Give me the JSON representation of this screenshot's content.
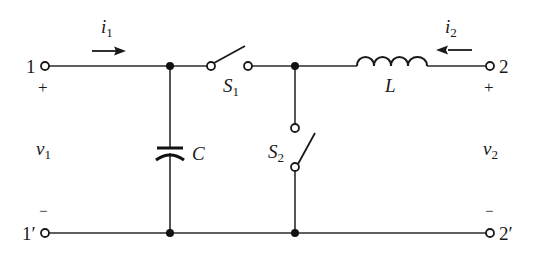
{
  "diagram": {
    "type": "two-port switched LC circuit",
    "colors": {
      "line": "#2a2a2a",
      "background": "#ffffff"
    },
    "ports": {
      "port1_top": "1",
      "port1_bottom": "1′",
      "port2_top": "2",
      "port2_bottom": "2′"
    },
    "polarity": {
      "v1_plus": "+",
      "v1_minus": "−",
      "v2_plus": "+",
      "v2_minus": "−"
    },
    "voltages": {
      "v1": {
        "sym": "v",
        "sub": "1"
      },
      "v2": {
        "sym": "v",
        "sub": "2"
      }
    },
    "currents": {
      "i1": {
        "sym": "i",
        "sub": "1",
        "direction": "right"
      },
      "i2": {
        "sym": "i",
        "sub": "2",
        "direction": "left"
      }
    },
    "components": {
      "capacitor": {
        "label": "C"
      },
      "inductor": {
        "label": "L"
      },
      "switch1": {
        "sym": "S",
        "sub": "1",
        "state": "open"
      },
      "switch2": {
        "sym": "S",
        "sub": "2",
        "state": "open"
      }
    }
  }
}
